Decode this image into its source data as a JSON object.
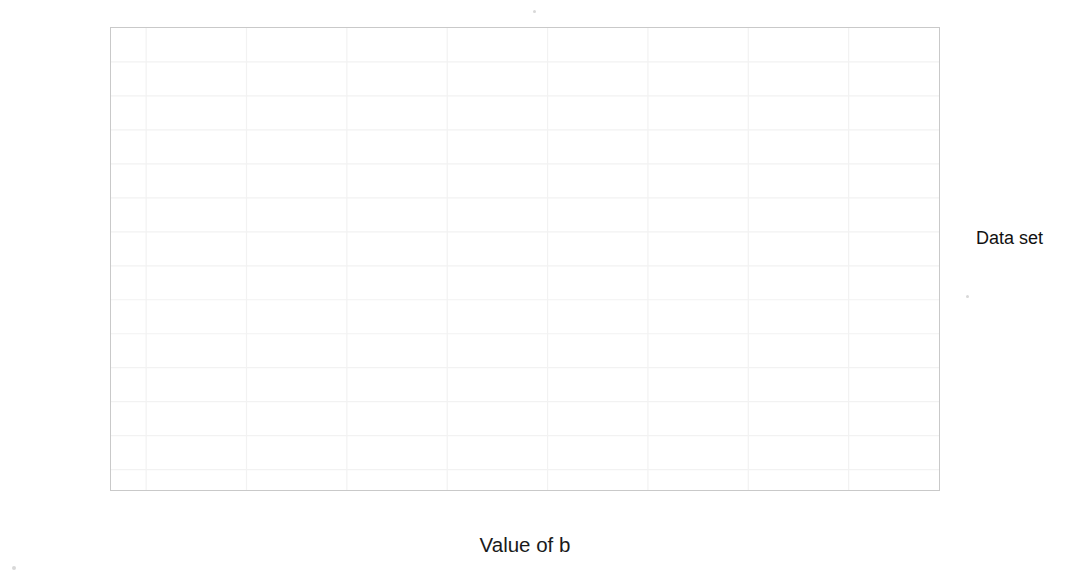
{
  "chart_data": {
    "type": "line",
    "title": "",
    "xlabel": "Value of b",
    "ylabel": "Sum of squared error",
    "xlim": [
      -0.35,
      7.9
    ],
    "ylim": [
      -6,
      130
    ],
    "xticks": [
      "0",
      "1",
      "2",
      "3",
      "4",
      "5",
      "6",
      "7"
    ],
    "xtick_values": [
      0,
      1,
      2,
      3,
      4,
      5,
      6,
      7
    ],
    "yticks": [
      "0",
      "10",
      "20",
      "30",
      "40",
      "50",
      "60",
      "70",
      "80",
      "90",
      "100",
      "110",
      "120"
    ],
    "ytick_values": [
      0,
      10,
      20,
      30,
      40,
      50,
      60,
      70,
      80,
      90,
      100,
      110,
      120
    ],
    "grid": true,
    "legend_position": "right",
    "series": [
      {
        "name": "Normal",
        "color": "#9e9e9e",
        "x": [
          0,
          0.13,
          0.26,
          0.39,
          0.52,
          0.65,
          0.78,
          0.91,
          1.04,
          1.17,
          1.3,
          1.43,
          1.56,
          1.69,
          1.82,
          1.95,
          2.08,
          2.21,
          2.34,
          2.47,
          2.6,
          2.73,
          2.86,
          2.99,
          3.12,
          3.25,
          3.38,
          3.51,
          3.64,
          3.77,
          3.9,
          4.03,
          4.16,
          4.29,
          4.42,
          4.55,
          4.68,
          4.81,
          4.94,
          5.07,
          5.2
        ],
        "y": [
          39,
          36.7,
          34.5,
          32.4,
          30.3,
          28.4,
          26.5,
          24.7,
          23,
          21.4,
          19.9,
          18.4,
          17.1,
          15.8,
          14.6,
          13.5,
          12.5,
          11.5,
          10.7,
          9.9,
          9.2,
          8.6,
          8.1,
          7.7,
          7.3,
          7,
          6.8,
          6.7,
          6.7,
          6.8,
          6.9,
          7.2,
          7.5,
          7.9,
          8.4,
          9,
          9.7,
          10.4,
          11.3,
          12.2,
          13.2
        ]
      },
      {
        "name": "Outlier",
        "color": "#c4c4c4",
        "x": [
          0,
          0.185,
          0.37,
          0.555,
          0.74,
          0.925,
          1.11,
          1.295,
          1.48,
          1.665,
          1.85,
          2.035,
          2.22,
          2.405,
          2.59,
          2.775,
          2.96,
          3.145,
          3.33,
          3.515,
          3.7,
          3.885,
          4.07,
          4.255,
          4.44,
          4.625,
          4.81,
          4.995,
          5.18,
          5.365,
          5.55,
          5.735,
          5.92,
          6.105,
          6.29,
          6.475,
          6.66,
          6.845,
          7.03,
          7.215,
          7.4
        ],
        "y": [
          123,
          117.5,
          112.3,
          107.3,
          102.6,
          98.1,
          93.8,
          89.8,
          86,
          82.4,
          79,
          75.9,
          73,
          70.3,
          67.8,
          65.5,
          63.5,
          61.7,
          60.1,
          58.7,
          57.5,
          56.6,
          55.9,
          55.4,
          55.1,
          55,
          55.2,
          55.6,
          56.2,
          57,
          58.1,
          59.4,
          60.9,
          62.6,
          64.5,
          66.7,
          69.1,
          71.7,
          74.5,
          77.6,
          80.9
        ]
      }
    ],
    "annotations": [
      {
        "name": "outlier-min-y",
        "label": "50.8",
        "value": 50.8,
        "axis": "y"
      },
      {
        "name": "normal-min-y",
        "label": "5.2",
        "value": 5.2,
        "axis": "y"
      },
      {
        "name": "normal-min-x",
        "label": "2.6",
        "value": 2.6,
        "axis": "x"
      },
      {
        "name": "outlier-min-x",
        "label": "3.8",
        "value": 3.8,
        "axis": "x"
      }
    ]
  },
  "legend": {
    "title": "Data set",
    "items": [
      {
        "label": "Normal",
        "color": "#9e9e9e"
      },
      {
        "label": "Outlier",
        "color": "#c4c4c4"
      }
    ]
  },
  "colors": {
    "axis_text": "#4d4d4d",
    "title_text": "#1a1a1a",
    "panel_border": "#c9c9c9",
    "grid": "#f2f2f2",
    "annotation_line": "#6b6b6b",
    "annotation_text": "#a5a5a5"
  }
}
